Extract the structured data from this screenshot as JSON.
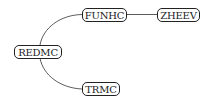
{
  "diagram": {
    "type": "tree",
    "nodes": [
      {
        "id": "redmc",
        "label": "REDMC"
      },
      {
        "id": "funhc",
        "label": "FUNHC"
      },
      {
        "id": "zheev",
        "label": "ZHEEV"
      },
      {
        "id": "trmc",
        "label": "TRMC"
      }
    ],
    "edges": [
      {
        "from": "REDMC",
        "to": "FUNHC"
      },
      {
        "from": "FUNHC",
        "to": "ZHEEV"
      },
      {
        "from": "REDMC",
        "to": "TRMC"
      }
    ]
  }
}
